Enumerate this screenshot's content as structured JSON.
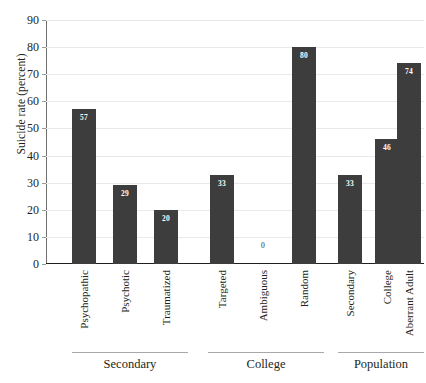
{
  "chart_data": {
    "type": "bar",
    "title": "",
    "subtitle": "",
    "xlabel": "",
    "ylabel": "Suicide rate (percent)",
    "ylim": [
      0,
      90
    ],
    "ytick_step": 10,
    "yticks": [
      90,
      80,
      70,
      60,
      50,
      40,
      30,
      20,
      10,
      0
    ],
    "ytick_labels": [
      "90",
      "80",
      "70",
      "60",
      "50",
      "40",
      "30",
      "20",
      "10",
      "0"
    ],
    "grid": true,
    "grid_axis": "y",
    "legend": false,
    "legend_position": "none",
    "bar_color": "#3d3d3d",
    "value_label_color": "#ffffff",
    "categories": [
      "Psychopathic",
      "Psychotic",
      "Traumatized",
      "Targeted",
      "Ambiguous",
      "Random",
      "Secondary",
      "College",
      "Aberrant Adult"
    ],
    "values": [
      57,
      29,
      20,
      33,
      0,
      80,
      33,
      46,
      74
    ],
    "value_labels": [
      "57",
      "29",
      "20",
      "33",
      "0",
      "80",
      "33",
      "46",
      "74"
    ],
    "groups": [
      {
        "label": "Secondary",
        "categories": [
          "Psychopathic",
          "Psychotic",
          "Traumatized"
        ],
        "values": [
          57,
          29,
          20
        ]
      },
      {
        "label": "College",
        "categories": [
          "Targeted",
          "Ambiguous",
          "Random"
        ],
        "values": [
          33,
          0,
          80
        ]
      },
      {
        "label": "Population",
        "categories": [
          "Secondary",
          "College",
          "Aberrant Adult"
        ],
        "values": [
          33,
          46,
          74
        ]
      }
    ],
    "group_labels": [
      "Secondary",
      "College",
      "Population"
    ]
  },
  "axis": {
    "y_title": "Suicide rate (percent)"
  },
  "bars": [
    {
      "category": "Psychopathic",
      "value": 57,
      "label": "57",
      "group": "Secondary"
    },
    {
      "category": "Psychotic",
      "value": 29,
      "label": "29",
      "group": "Secondary"
    },
    {
      "category": "Traumatized",
      "value": 20,
      "label": "20",
      "group": "Secondary"
    },
    {
      "category": "Targeted",
      "value": 33,
      "label": "33",
      "group": "College"
    },
    {
      "category": "Ambiguous",
      "value": 0,
      "label": "0",
      "group": "College"
    },
    {
      "category": "Random",
      "value": 80,
      "label": "80",
      "group": "College"
    },
    {
      "category": "Secondary",
      "value": 33,
      "label": "33",
      "group": "Population"
    },
    {
      "category": "College",
      "value": 46,
      "label": "46",
      "group": "Population"
    },
    {
      "category": "Aberrant Adult",
      "value": 74,
      "label": "74",
      "group": "Population"
    }
  ],
  "groups": [
    {
      "label": "Secondary"
    },
    {
      "label": "College"
    },
    {
      "label": "Population"
    }
  ]
}
